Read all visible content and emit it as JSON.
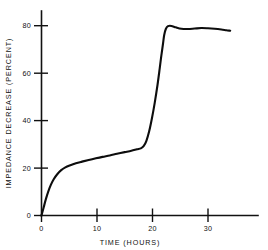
{
  "chart_data": {
    "type": "line",
    "title": "",
    "subtitle": "",
    "xlabel": "TIME (HOURS)",
    "ylabel": "IMPEDANCE DECREASE (PERCENT)",
    "xlim": [
      0,
      39
    ],
    "ylim": [
      0,
      85
    ],
    "xticks": [
      0,
      10,
      20,
      30
    ],
    "xtick_labels": [
      "0",
      "10",
      "20",
      "30"
    ],
    "yticks": [
      0,
      20,
      40,
      60,
      80
    ],
    "ytick_labels": [
      "0",
      "20",
      "40",
      "60",
      "80"
    ],
    "grid": false,
    "legend": false,
    "legend_position": "none",
    "line_color": "#0d0d0d",
    "axis_color": "#111111",
    "background_color": "#ffffff",
    "series": [
      {
        "name": "impedance decrease",
        "x": [
          0,
          0.4,
          0.8,
          1.2,
          1.7,
          2.2,
          2.8,
          3.5,
          4.3,
          5.2,
          6.2,
          7.3,
          8.5,
          9.8,
          11.0,
          12.3,
          13.6,
          15.0,
          16.2,
          17.2,
          17.9,
          18.4,
          18.9,
          19.4,
          19.9,
          20.4,
          20.9,
          21.3,
          21.6,
          21.9,
          22.1,
          22.4,
          22.8,
          23.4,
          24.2,
          25.2,
          26.4,
          27.6,
          28.8,
          30.0,
          31.2,
          32.4,
          33.3,
          34.0
        ],
        "y": [
          0,
          3.5,
          7.0,
          10.0,
          13.0,
          15.3,
          17.3,
          19.0,
          20.3,
          21.2,
          22.0,
          22.7,
          23.4,
          24.1,
          24.7,
          25.3,
          26.0,
          26.7,
          27.3,
          27.9,
          28.3,
          29.2,
          31.5,
          35.5,
          41.0,
          47.5,
          55.0,
          62.0,
          67.5,
          72.5,
          76.0,
          78.6,
          79.8,
          79.9,
          79.3,
          78.7,
          78.6,
          78.8,
          79.0,
          78.9,
          78.7,
          78.4,
          78.1,
          77.9
        ]
      }
    ],
    "annotations": []
  },
  "figure": {
    "caption": ""
  }
}
